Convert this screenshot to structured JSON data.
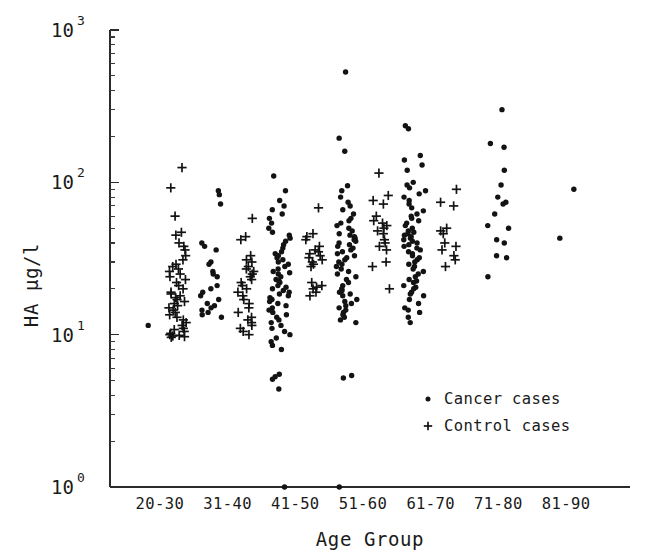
{
  "chart_data": {
    "type": "scatter",
    "title": "",
    "xlabel": "Age Group",
    "ylabel": "HA µg/l",
    "yscale": "log",
    "ylim": [
      1,
      1000
    ],
    "ytick_labels": [
      "10",
      "10",
      "10",
      "10"
    ],
    "ytick_exponents": [
      "0",
      "1",
      "2",
      "3"
    ],
    "ytick_values": [
      1,
      10,
      100,
      1000
    ],
    "grid": false,
    "legend_position": "lower-right",
    "categories": [
      "20-30",
      "31-40",
      "41-50",
      "51-60",
      "61-70",
      "71-80",
      "81-90"
    ],
    "series": [
      {
        "name": "Cancer cases",
        "marker": "dot",
        "marker_symbol": "•",
        "color": "#131313",
        "points": [
          {
            "group": "20-30",
            "values": [
              11.5
            ]
          },
          {
            "group": "31-40",
            "values": [
              88,
              83,
              72,
              40,
              38,
              36,
              30,
              29,
              26,
              25,
              24,
              21,
              20,
              19,
              18,
              17,
              16,
              15.5,
              15,
              14.5,
              14,
              13.5,
              13
            ]
          },
          {
            "group": "41-50",
            "values": [
              110,
              88,
              76,
              70,
              66,
              62,
              58,
              54,
              50,
              47,
              45,
              43,
              41,
              39,
              37,
              35,
              34,
              33,
              32,
              31,
              30,
              29,
              28,
              27,
              26,
              25.5,
              25,
              24,
              23,
              22.5,
              22,
              21,
              20.5,
              20,
              19.5,
              19,
              18.5,
              18,
              17.5,
              17,
              16.5,
              16,
              15.5,
              15,
              14.5,
              14,
              13.5,
              13,
              12.5,
              12,
              11.5,
              11,
              10.5,
              10,
              9.5,
              9,
              8.5,
              8,
              5.5,
              5.3,
              5.1,
              4.4,
              1.0
            ]
          },
          {
            "group": "51-60",
            "values": [
              530,
              195,
              160,
              95,
              88,
              80,
              74,
              70,
              66,
              62,
              58,
              56,
              54,
              52,
              50,
              48,
              46,
              45,
              44,
              43,
              42,
              41,
              40,
              39,
              38,
              37,
              36,
              35,
              34,
              33,
              32,
              31,
              30,
              29,
              28,
              27,
              26,
              25,
              24,
              23,
              22,
              21,
              20,
              19.5,
              19,
              18.5,
              18,
              17,
              16.5,
              16,
              15.5,
              15,
              14.5,
              14,
              13.5,
              13,
              12.5,
              12,
              5.4,
              5.2,
              1.0
            ]
          },
          {
            "group": "61-70",
            "values": [
              235,
              225,
              150,
              140,
              130,
              120,
              100,
              96,
              92,
              88,
              84,
              80,
              76,
              72,
              68,
              65,
              62,
              60,
              58,
              56,
              54,
              52,
              50,
              48,
              47,
              46,
              45,
              44,
              43,
              42,
              41,
              40,
              39,
              38,
              37,
              36,
              35,
              34,
              33,
              32,
              31,
              30,
              29,
              28,
              27,
              26,
              25,
              24,
              23,
              22.5,
              22,
              21,
              20.5,
              20,
              19,
              18.5,
              18,
              17,
              16,
              15,
              14.5,
              14,
              13,
              12
            ]
          },
          {
            "group": "71-80",
            "values": [
              300,
              180,
              170,
              120,
              96,
              80,
              74,
              72,
              62,
              52,
              50,
              42,
              40,
              33,
              32,
              24
            ]
          },
          {
            "group": "81-90",
            "values": [
              90,
              43
            ]
          }
        ]
      },
      {
        "name": "Control cases",
        "marker": "plus",
        "marker_symbol": "+",
        "color": "#131313",
        "points": [
          {
            "group": "20-30",
            "values": [
              125,
              92,
              60,
              47,
              45,
              40,
              38,
              36,
              33,
              31,
              29,
              28,
              27,
              26,
              25,
              24,
              23,
              22,
              21,
              20,
              19,
              18.5,
              18,
              17.5,
              17,
              16.5,
              16,
              15.5,
              15,
              14.5,
              14,
              13.5,
              13,
              12.5,
              12,
              11.5,
              11,
              10.8,
              10.5,
              10.2,
              10,
              9.9,
              9.8,
              9.7,
              9.6
            ]
          },
          {
            "group": "31-40",
            "values": [
              58,
              44,
              42,
              33,
              31,
              30,
              28,
              27,
              26,
              25,
              24,
              23,
              22,
              21,
              20,
              19,
              18,
              17,
              16,
              15,
              14,
              13,
              12.5,
              12,
              11.5,
              11,
              10.5,
              10
            ]
          },
          {
            "group": "41-50",
            "values": [
              68,
              46,
              44,
              42,
              38,
              36,
              35,
              34,
              33,
              32,
              31,
              30,
              29,
              28,
              22,
              21,
              20.5,
              20,
              19,
              18
            ]
          },
          {
            "group": "51-60",
            "values": [
              115,
              82,
              76,
              72,
              60,
              56,
              54,
              52,
              50,
              48,
              46,
              42,
              40,
              38,
              36,
              30,
              28,
              20
            ]
          },
          {
            "group": "61-70",
            "values": [
              90,
              74,
              70,
              50,
              48,
              46,
              40,
              38,
              36,
              33,
              31,
              28
            ]
          }
        ]
      }
    ]
  },
  "legend": {
    "items": [
      {
        "symbol": "•",
        "label": "Cancer cases"
      },
      {
        "symbol": "+",
        "label": "Control cases"
      }
    ]
  }
}
